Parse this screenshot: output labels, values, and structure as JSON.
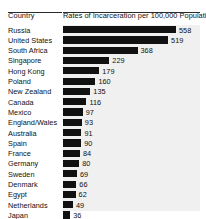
{
  "header": {
    "country_label": "Country",
    "title": "Rates of Incarceration per 100,000 Population"
  },
  "chart_data": {
    "type": "bar",
    "orientation": "horizontal",
    "title": "Rates of Incarceration per 100,000 Population",
    "xlabel": "Rates of Incarceration per 100,000 Population",
    "ylabel": "Country",
    "grid": false,
    "legend": false,
    "xlim": [
      0,
      558
    ],
    "bar_color": "#111111",
    "plot_background": "#f0f0f0",
    "value_label_position": "outside-end",
    "categories": [
      "Russia",
      "United States",
      "South Africa",
      "Singapore",
      "Hong Kong",
      "Poland",
      "New Zealand",
      "Canada",
      "Mexico",
      "England/Wales",
      "Australia",
      "Spain",
      "France",
      "Germany",
      "Sweden",
      "Denmark",
      "Egypt",
      "Netherlands",
      "Japan",
      "India"
    ],
    "values": [
      558,
      519,
      368,
      229,
      179,
      160,
      135,
      116,
      97,
      93,
      91,
      90,
      84,
      80,
      69,
      66,
      62,
      49,
      36,
      23
    ]
  }
}
